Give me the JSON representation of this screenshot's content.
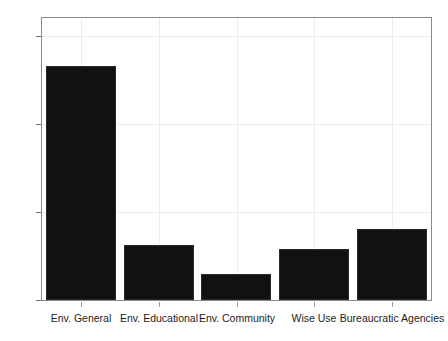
{
  "chart_data": {
    "type": "bar",
    "title": "",
    "subtitle": "",
    "xlabel": "",
    "ylabel": "",
    "categories": [
      "Env. General",
      "Env. Educational",
      "Env. Community",
      "Wise Use",
      "Bureaucratic Agencies"
    ],
    "values": [
      133,
      31,
      15,
      29,
      40
    ],
    "ylim": [
      0,
      160
    ],
    "yticks": [
      0,
      50,
      100,
      150
    ],
    "ytick_labels": [
      "0",
      "50",
      "100",
      "150"
    ],
    "grid": "both",
    "legend": "none",
    "bar_color": "#111111",
    "grid_color": "#ececec",
    "frame_color": "#8a8a8a",
    "background": "#ffffff",
    "annotations": []
  }
}
